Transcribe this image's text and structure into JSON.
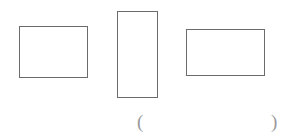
{
  "page": {
    "kind": "worksheet-figure",
    "background_color": "#ffffff",
    "width": 286,
    "height": 137
  },
  "figure": {
    "label": "three-rectangles-figure",
    "stroke_color": "#6b6b6b",
    "fill_color": "#ffffff",
    "stroke_width": 1,
    "shapes": [
      {
        "name": "rectangle-left",
        "shape": "rectangle",
        "x": 19,
        "y": 26,
        "width": 69,
        "height": 52,
        "orientation": "landscape"
      },
      {
        "name": "rectangle-middle",
        "shape": "rectangle",
        "x": 117,
        "y": 11,
        "width": 41,
        "height": 87,
        "orientation": "portrait"
      },
      {
        "name": "rectangle-right",
        "shape": "rectangle",
        "x": 186,
        "y": 29,
        "width": 79,
        "height": 47,
        "orientation": "landscape"
      }
    ]
  },
  "answer": {
    "name": "answer-parentheses",
    "open_paren": "(",
    "close_paren": ")",
    "value": "",
    "placeholder": "",
    "paren_color": "#9a9a9a",
    "open_paren_x": 137,
    "close_paren_x": 271,
    "baseline_y": 112
  }
}
